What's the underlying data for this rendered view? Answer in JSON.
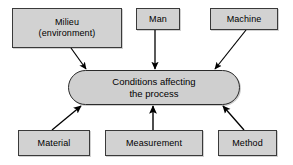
{
  "diagram": {
    "type": "cause-and-effect",
    "title": "",
    "center": {
      "label": "Conditions affecting\nthe process",
      "shape": "rounded-pill",
      "fill": "#cfcfcf",
      "stroke": "#2b2b2b"
    },
    "causes": [
      {
        "id": "milieu",
        "label": "Milieu\n(environment)",
        "position": "top-left"
      },
      {
        "id": "man",
        "label": "Man",
        "position": "top-center"
      },
      {
        "id": "machine",
        "label": "Machine",
        "position": "top-right"
      },
      {
        "id": "material",
        "label": "Material",
        "position": "bottom-left"
      },
      {
        "id": "measurement",
        "label": "Measurement",
        "position": "bottom-center"
      },
      {
        "id": "method",
        "label": "Method",
        "position": "bottom-right"
      }
    ],
    "arrows": [
      {
        "from": "milieu",
        "to": "center",
        "x1": 71,
        "y1": 48,
        "x2": 87,
        "y2": 70
      },
      {
        "from": "man",
        "to": "center",
        "x1": 155,
        "y1": 30,
        "x2": 155,
        "y2": 70
      },
      {
        "from": "machine",
        "to": "center",
        "x1": 246,
        "y1": 30,
        "x2": 214,
        "y2": 70
      },
      {
        "from": "material",
        "to": "center",
        "x1": 52,
        "y1": 130,
        "x2": 80,
        "y2": 105
      },
      {
        "from": "measurement",
        "to": "center",
        "x1": 153,
        "y1": 130,
        "x2": 153,
        "y2": 105
      },
      {
        "from": "method",
        "to": "center",
        "x1": 244,
        "y1": 130,
        "x2": 222,
        "y2": 105
      }
    ],
    "colors": {
      "box_fill": "#d2d2d2",
      "box_stroke": "#3a3a3a",
      "arrow": "#000000",
      "background": "#ffffff",
      "text": "#000000"
    }
  }
}
